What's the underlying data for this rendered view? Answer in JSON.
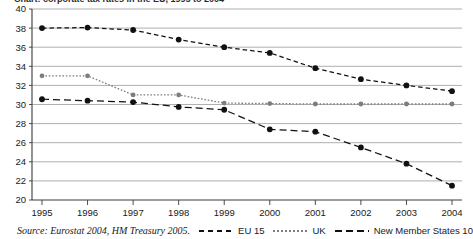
{
  "title_partial": "Chart: corporate tax rates in the EU, 1995 to 2004",
  "footer": {
    "source": "Source: Eurostat 2004, HM Treasury 2005."
  },
  "legend": {
    "items": [
      {
        "label": "EU 15",
        "style": "dashed",
        "color": "#111111"
      },
      {
        "label": "UK",
        "style": "dotted",
        "color": "#7d7d7d"
      },
      {
        "label": "New Member States 10",
        "style": "long-dash",
        "color": "#111111"
      }
    ]
  },
  "axes": {
    "y_ticks": [
      "40",
      "38",
      "36",
      "34",
      "32",
      "30",
      "28",
      "26",
      "24",
      "22",
      "20"
    ],
    "x_ticks": [
      "1995",
      "1996",
      "1997",
      "1998",
      "1999",
      "2000",
      "2001",
      "2002",
      "2003",
      "2004"
    ]
  },
  "chart_data": {
    "type": "line",
    "title": "",
    "xlabel": "",
    "ylabel": "",
    "xlim": [
      1995,
      2004
    ],
    "ylim": [
      20,
      40
    ],
    "ytick_step": 2,
    "grid": true,
    "legend_position": "bottom",
    "categories": [
      "1995",
      "1996",
      "1997",
      "1998",
      "1999",
      "2000",
      "2001",
      "2002",
      "2003",
      "2004"
    ],
    "series": [
      {
        "name": "EU 15",
        "color": "#111111",
        "line_style": "dashed",
        "marker": "circle",
        "values": [
          38.0,
          38.05,
          37.8,
          36.8,
          36.0,
          35.4,
          33.8,
          32.65,
          32.0,
          31.4
        ]
      },
      {
        "name": "UK",
        "color": "#7d7d7d",
        "line_style": "dotted",
        "marker": "circle",
        "values": [
          33.0,
          33.0,
          31.0,
          31.0,
          30.15,
          30.1,
          30.05,
          30.05,
          30.05,
          30.05
        ]
      },
      {
        "name": "New Member States 10",
        "color": "#111111",
        "line_style": "long-dash",
        "marker": "circle",
        "values": [
          30.55,
          30.4,
          30.25,
          29.75,
          29.45,
          27.4,
          27.15,
          25.5,
          23.8,
          21.5
        ]
      }
    ]
  }
}
